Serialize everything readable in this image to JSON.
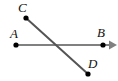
{
  "figure": {
    "background_color": "#ffffff",
    "width": 118,
    "height": 81,
    "points": [
      {
        "id": "A",
        "label": "A",
        "x": 16,
        "y": 45,
        "marker": "filled-dot",
        "label_position": "above-left"
      },
      {
        "id": "B",
        "label": "B",
        "x": 103,
        "y": 45,
        "marker": "filled-dot",
        "label_position": "above"
      },
      {
        "id": "C",
        "label": "C",
        "x": 26,
        "y": 18,
        "marker": "filled-dot",
        "label_position": "above-left"
      },
      {
        "id": "D",
        "label": "D",
        "x": 88,
        "y": 74,
        "marker": "filled-dot",
        "label_position": "above-right"
      }
    ],
    "lines": [
      {
        "id": "AB",
        "name": "ray-A-B",
        "from": "A",
        "to": "B",
        "x1": 15,
        "y1": 45,
        "x2": 117,
        "y2": 45,
        "color": "#808080",
        "stroke_width": 2,
        "arrow_end": true
      },
      {
        "id": "CD",
        "name": "segment-C-D",
        "from": "C",
        "to": "D",
        "x1": 26,
        "y1": 18,
        "x2": 88,
        "y2": 74,
        "color": "#555555",
        "stroke_width": 2,
        "arrow_end": false
      }
    ],
    "intersection": {
      "x": 62,
      "y": 45
    },
    "marker_color": "#000000",
    "marker_radius": 2.6,
    "label_color": "#111111"
  }
}
